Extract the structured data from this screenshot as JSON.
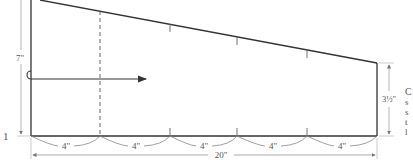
{
  "diagram": {
    "type": "pattern-panel-dimension-drawing",
    "left_height_label": "7\"",
    "right_height_label": "3½\"",
    "total_width_label": "20\"",
    "segment_labels": [
      "4\"",
      "4\"",
      "4\"",
      "4\"",
      "4\""
    ],
    "step_number": "1",
    "side_text_fragments": [
      "C",
      "s",
      "s",
      "t",
      "l"
    ],
    "colors": {
      "outline": "#333333",
      "dimension": "#888888",
      "text": "#555555"
    }
  }
}
